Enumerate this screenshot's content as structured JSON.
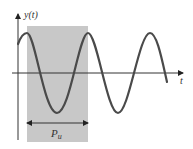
{
  "diagram": {
    "y_axis_label": "y(t)",
    "x_axis_label": "t",
    "period_label_main": "P",
    "period_label_sub": "u",
    "colors": {
      "background": "#ffffff",
      "shade": "#c8c8c8",
      "curve": "#4a4a4a",
      "axis": "#333333"
    }
  }
}
